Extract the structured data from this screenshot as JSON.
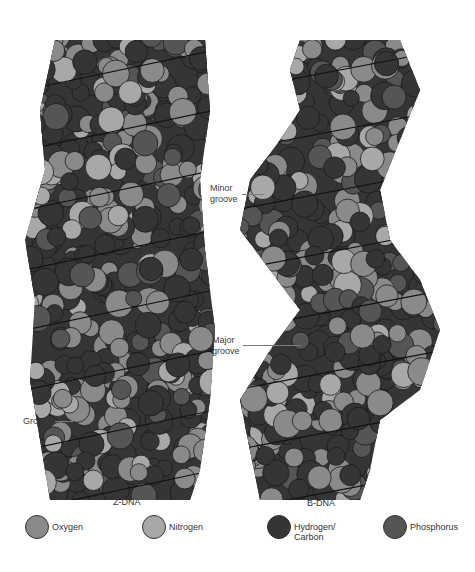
{
  "figure": {
    "models": [
      {
        "name": "Z-DNA",
        "caption": "Z-DNA"
      },
      {
        "name": "B-DNA",
        "caption": "B-DNA"
      }
    ],
    "annotations": {
      "minor_groove": "Minor\ngroove",
      "major_groove": "Major\ngroove",
      "groove": "Groove"
    }
  },
  "legend": [
    {
      "label": "Oxygen",
      "color": "#8a8a8a"
    },
    {
      "label": "Nitrogen",
      "color": "#a8a8a8"
    },
    {
      "label": "Hydrogen/\nCarbon",
      "color": "#353535"
    },
    {
      "label": "Phosphorus",
      "color": "#555555"
    }
  ],
  "colors": {
    "oxygen": "#8a8a8a",
    "nitrogen": "#a8a8a8",
    "hydrogen_carbon": "#353535",
    "phosphorus": "#555555",
    "outline": "#1c1c1c"
  }
}
